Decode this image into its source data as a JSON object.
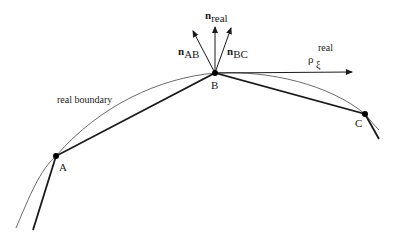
{
  "diagram": {
    "type": "boundary-discretization",
    "curve_label": "real boundary",
    "points": [
      {
        "id": "A",
        "label": "A",
        "x": 56,
        "y": 156
      },
      {
        "id": "B",
        "label": "B",
        "x": 215,
        "y": 73
      },
      {
        "id": "C",
        "label": "C",
        "x": 365,
        "y": 114
      }
    ],
    "vectors": [
      {
        "id": "n_AB",
        "symbol": "n",
        "subscript": "AB",
        "superscript": ""
      },
      {
        "id": "n_real",
        "symbol": "n",
        "subscript": "real",
        "superscript": ""
      },
      {
        "id": "n_BC",
        "symbol": "n",
        "subscript": "BC",
        "superscript": ""
      },
      {
        "id": "rho",
        "symbol": "ρ",
        "subscript": "ξ",
        "superscript": "real"
      }
    ],
    "colors": {
      "line": "#1a1a1a",
      "curve": "#444444",
      "background": "#ffffff"
    }
  }
}
